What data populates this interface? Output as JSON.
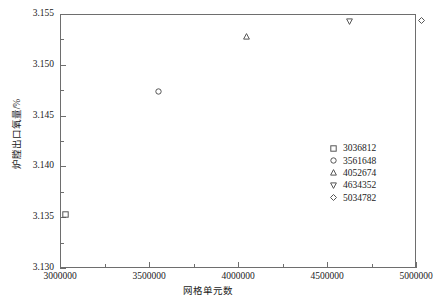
{
  "chart_data": {
    "type": "scatter",
    "title": "",
    "xlabel": "网格单元数",
    "ylabel": "炉膛出口氧量/%",
    "xlim": [
      3000000,
      5000000
    ],
    "ylim": [
      3.13,
      3.155
    ],
    "grid": false,
    "legend_position": "inside-right",
    "x_ticks": [
      3000000,
      3500000,
      4000000,
      4500000,
      5000000
    ],
    "x_tick_labels": [
      "3000000",
      "3500000",
      "4000000",
      "4500000",
      "5000000"
    ],
    "x_minor_ticks": [
      3250000,
      3750000,
      4250000,
      4750000
    ],
    "y_ticks": [
      3.13,
      3.135,
      3.14,
      3.145,
      3.15,
      3.155
    ],
    "y_tick_labels": [
      "3.130",
      "3.135",
      "3.140",
      "3.145",
      "3.150",
      "3.155"
    ],
    "y_minor_ticks": [
      3.1325,
      3.1375,
      3.1425,
      3.1475,
      3.1525
    ],
    "series": [
      {
        "name": "3036812",
        "marker": "square",
        "x": 3036812,
        "y": 3.1352
      },
      {
        "name": "3561648",
        "marker": "circle",
        "x": 3561648,
        "y": 3.1473
      },
      {
        "name": "4052674",
        "marker": "triangle-up",
        "x": 4052674,
        "y": 3.1527
      },
      {
        "name": "4634352",
        "marker": "triangle-down",
        "x": 4634352,
        "y": 3.1542
      },
      {
        "name": "5034782",
        "marker": "diamond",
        "x": 5034782,
        "y": 3.1543
      }
    ],
    "colors": {
      "axis": "#6e6e6e",
      "marker": "#555555",
      "background": "#ffffff"
    }
  }
}
